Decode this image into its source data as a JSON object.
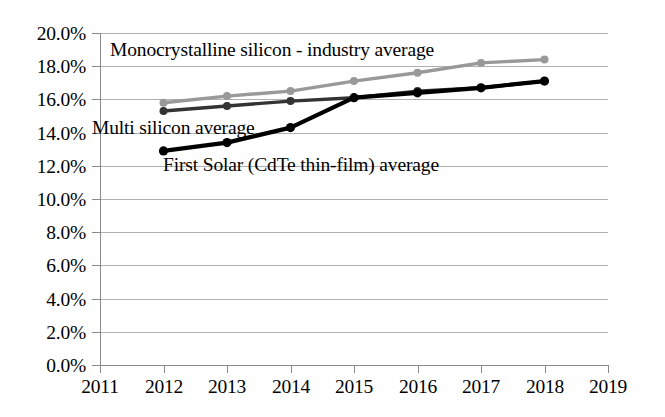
{
  "chart_data": {
    "type": "line",
    "title": "",
    "subtitle": "",
    "xlabel": "",
    "ylabel": "",
    "x": [
      2011,
      2012,
      2013,
      2014,
      2015,
      2016,
      2017,
      2018,
      2019
    ],
    "xtick_labels": [
      "2011",
      "2012",
      "2013",
      "2014",
      "2015",
      "2016",
      "2017",
      "2018",
      "2019"
    ],
    "ytick_labels": [
      "0.0%",
      "2.0%",
      "4.0%",
      "6.0%",
      "8.0%",
      "10.0%",
      "12.0%",
      "14.0%",
      "16.0%",
      "18.0%",
      "20.0%"
    ],
    "ytick_values": [
      0,
      2,
      4,
      6,
      8,
      10,
      12,
      14,
      16,
      18,
      20
    ],
    "xlim": [
      2011,
      2019
    ],
    "ylim": [
      0,
      20
    ],
    "grid": true,
    "legend_position": "inline-annotations",
    "series": [
      {
        "name": "Monocrystalline silicon - industry average",
        "color": "#999999",
        "marker": "circle",
        "x": [
          2012,
          2013,
          2014,
          2015,
          2016,
          2017,
          2018
        ],
        "values": [
          15.8,
          16.2,
          16.5,
          17.1,
          17.6,
          18.2,
          18.4
        ]
      },
      {
        "name": "Multi silicon average",
        "color": "#333333",
        "marker": "circle",
        "x": [
          2012,
          2013,
          2014,
          2015,
          2016,
          2017,
          2018
        ],
        "values": [
          15.3,
          15.6,
          15.9,
          16.1,
          16.5,
          16.7,
          17.1
        ]
      },
      {
        "name": "First Solar (CdTe thin-film) average",
        "color": "#000000",
        "marker": "circle",
        "x": [
          2012,
          2013,
          2014,
          2015,
          2016,
          2017,
          2018
        ],
        "values": [
          12.9,
          13.4,
          14.3,
          16.1,
          16.4,
          16.7,
          17.1
        ]
      }
    ],
    "annotations": [
      {
        "text": "Monocrystalline silicon - industry average",
        "series": "Monocrystalline silicon - industry average"
      },
      {
        "text": "Multi silicon average",
        "series": "Multi silicon average"
      },
      {
        "text": "First Solar (CdTe thin-film) average",
        "series": "First Solar (CdTe thin-film) average"
      }
    ],
    "colors": {
      "mono": "#999999",
      "multi": "#333333",
      "first_solar": "#000000",
      "gridline": "#b0b0b0",
      "axis": "#8a8a8a",
      "background": "#ffffff",
      "text": "#000000"
    }
  }
}
